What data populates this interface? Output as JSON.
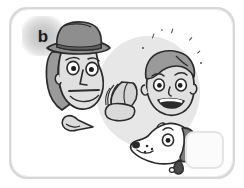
{
  "panel": {
    "label": "b",
    "exercise_type": "picture-prompt-with-answer-box",
    "style": "greyscale line-art cartoon illustration",
    "frame": {
      "shape": "rounded-rectangle",
      "border_color": "#d8d8d8"
    },
    "background_blob": {
      "shape": "circle",
      "color": "#e7e7e7"
    }
  },
  "colors": {
    "ink": "#2b2b2b",
    "frame": "#d8d8d8",
    "blob": "#e7e7e7",
    "skin": "#e0e0e0",
    "hair": "#9a9a9a",
    "hat": "#8e8e8e",
    "hat_band": "#6d6d6d",
    "dog_ear": "#7d7d7d",
    "white": "#ffffff",
    "answer_box_border": "#e4e4e4"
  },
  "figures": [
    {
      "name": "man-with-hat",
      "description": "Man's head in three-quarter view wearing a dark grey fedora hat, wide open eyes, long angular nose and a straight closed mouth",
      "expression": "surprised",
      "accessory": "fedora-hat"
    },
    {
      "name": "smiling-boy",
      "description": "Boy's head with grey hair, round eyes and a wide open smile showing teeth",
      "expression": "happy",
      "accessory": "none"
    },
    {
      "name": "dog-head",
      "description": "Dog head in profile at lower right, white muzzle with spots, dark grey ear and a small collar",
      "expression": "neutral",
      "accessory": "collar"
    },
    {
      "name": "feather-object",
      "description": "Grey feather or wing shaped object floating in the centre of the panel"
    },
    {
      "name": "small-pointed-object",
      "description": "Small grey pointed shape at lower left, like a beak or shoe"
    }
  ],
  "decorations": {
    "sparkles": "small scattered tick marks above the boy's head",
    "sparkle_count": 7
  },
  "answer_box": {
    "name": "answer-box",
    "value": "",
    "placeholder": ""
  }
}
